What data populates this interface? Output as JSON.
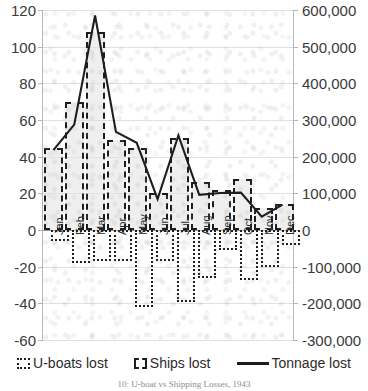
{
  "chart_data": {
    "type": "bar",
    "title": "",
    "caption": "10: U-boat vs Shipping Losses, 1943",
    "categories": [
      "Jan",
      "Feb",
      "Mar",
      "Apr",
      "May",
      "Jun",
      "Jul",
      "Aug",
      "Sep",
      "Oct",
      "Nov",
      "Dec"
    ],
    "series": [
      {
        "name": "Ships lost",
        "axis": "left",
        "style": "dashed-outline-bar",
        "values": [
          45,
          70,
          108,
          49,
          45,
          20,
          50,
          26,
          22,
          28,
          12,
          14
        ]
      },
      {
        "name": "U-boats lost",
        "axis": "left",
        "style": "dotted-outline-bar",
        "values": [
          -6,
          -18,
          -17,
          -17,
          -42,
          -17,
          -39,
          -26,
          -11,
          -27,
          -20,
          -8
        ]
      },
      {
        "name": "Tonnage lost",
        "axis": "right",
        "style": "solid-line",
        "values": [
          215000,
          285000,
          585000,
          265000,
          235000,
          80000,
          255000,
          92000,
          97000,
          98000,
          32000,
          65000
        ]
      }
    ],
    "xlabel": "",
    "ylabel_left": "",
    "ylabel_right": "",
    "ylim_left": [
      -60,
      120
    ],
    "ylim_right": [
      -300000,
      600000
    ],
    "ytick_left": [
      "120",
      "100",
      "80",
      "60",
      "40",
      "20",
      "0",
      "-20",
      "-40",
      "-60"
    ],
    "ytick_right": [
      "600,000",
      "500,000",
      "400,000",
      "300,000",
      "200,000",
      "100,000",
      "0",
      "-100,000",
      "-200,000",
      "-300,000"
    ],
    "grid": true,
    "legend_position": "bottom"
  },
  "legend": {
    "items": [
      {
        "label": "U-boats lost",
        "marker": "dotted-square-icon"
      },
      {
        "label": "Ships lost",
        "marker": "dashed-square-icon"
      },
      {
        "label": "Tonnage lost",
        "marker": "solid-line-icon"
      }
    ]
  }
}
